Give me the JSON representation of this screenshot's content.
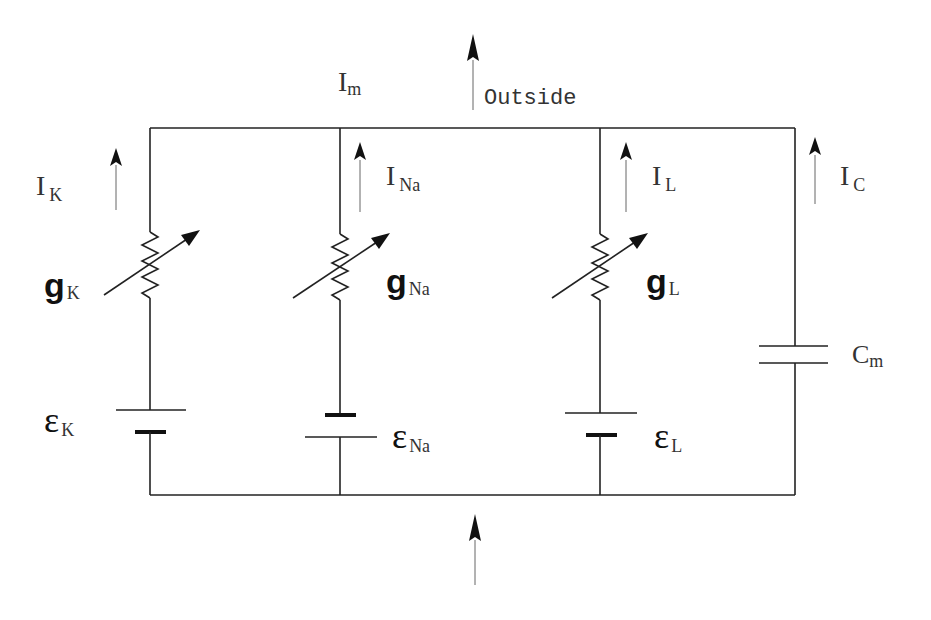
{
  "diagram": {
    "labels": {
      "membrane_current": {
        "main": "I",
        "sub": "m"
      },
      "outside": "Outside",
      "potassium_current": {
        "main": "I",
        "sub": "K"
      },
      "sodium_current": {
        "main": "I",
        "sub": "Na"
      },
      "leak_current": {
        "main": "I",
        "sub": "L"
      },
      "capacitive_current": {
        "main": "I",
        "sub": "C"
      },
      "potassium_conductance": {
        "main": "g",
        "sub": "K"
      },
      "sodium_conductance": {
        "main": "g",
        "sub": "Na"
      },
      "leak_conductance": {
        "main": "g",
        "sub": "L"
      },
      "potassium_emf": {
        "main": "ε",
        "sub": "K"
      },
      "sodium_emf": {
        "main": "ε",
        "sub": "Na"
      },
      "leak_emf": {
        "main": "ε",
        "sub": "L"
      },
      "membrane_capacitance": {
        "main": "C",
        "sub": "m"
      }
    },
    "branches": [
      {
        "name": "K",
        "components": [
          "variable-resistor",
          "battery"
        ],
        "battery_orientation": "long-plate-top"
      },
      {
        "name": "Na",
        "components": [
          "variable-resistor",
          "battery"
        ],
        "battery_orientation": "short-plate-top"
      },
      {
        "name": "L",
        "components": [
          "variable-resistor",
          "battery"
        ],
        "battery_orientation": "long-plate-top"
      },
      {
        "name": "C",
        "components": [
          "capacitor"
        ]
      }
    ],
    "colors": {
      "wire": "#222222",
      "current_arrow_shaft": "#666666",
      "text": "#333333",
      "background": "#ffffff"
    }
  }
}
